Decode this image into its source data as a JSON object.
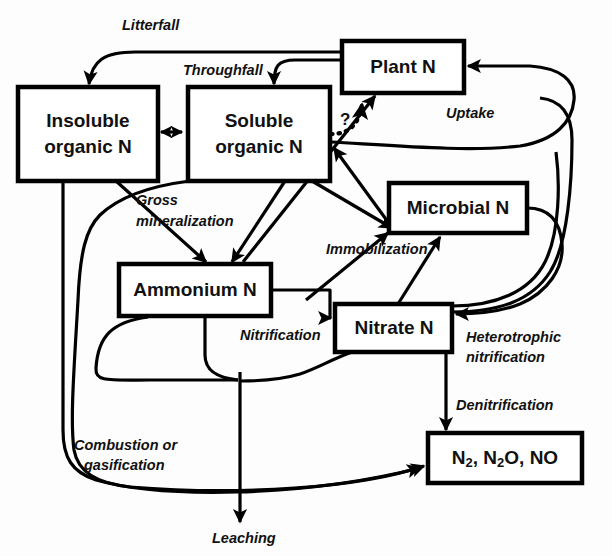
{
  "figure": {
    "background_color": "#fdfdfd",
    "line_color": "#000000",
    "box_fill": "#ffffff"
  },
  "pools": [
    {
      "id": "insoluble-organic-n",
      "line1": "Insoluble",
      "line2": "organic N"
    },
    {
      "id": "soluble-organic-n",
      "line1": "Soluble",
      "line2": "organic N"
    },
    {
      "id": "plant-n",
      "line1": "Plant N",
      "line2": ""
    },
    {
      "id": "microbial-n",
      "line1": "Microbial N",
      "line2": ""
    },
    {
      "id": "ammonium-n",
      "line1": "Ammonium N",
      "line2": ""
    },
    {
      "id": "nitrate-n",
      "line1": "Nitrate N",
      "line2": ""
    },
    {
      "id": "gases",
      "line1": "N2, N2O, NO",
      "line2": ""
    }
  ],
  "gas_box": {
    "segments": [
      "N",
      "2",
      ", N",
      "2",
      "O, NO"
    ]
  },
  "fluxes": [
    {
      "id": "litterfall",
      "line1": "Litterfall",
      "line2": ""
    },
    {
      "id": "throughfall",
      "line1": "Throughfall",
      "line2": ""
    },
    {
      "id": "gross-mineralization",
      "line1": "Gross",
      "line2": "mineralization"
    },
    {
      "id": "uptake",
      "line1": "Uptake",
      "line2": ""
    },
    {
      "id": "unknown",
      "line1": "?",
      "line2": ""
    },
    {
      "id": "immobilization",
      "line1": "Immobilization",
      "line2": ""
    },
    {
      "id": "nitrification",
      "line1": "Nitrification",
      "line2": ""
    },
    {
      "id": "heterotrophic-nitrification",
      "line1": "Heterotrophic",
      "line2": "nitrification"
    },
    {
      "id": "denitrification",
      "line1": "Denitrification",
      "line2": ""
    },
    {
      "id": "combustion-or-gasification",
      "line1": "Combustion or",
      "line2": "gasification"
    },
    {
      "id": "leaching",
      "line1": "Leaching",
      "line2": ""
    }
  ]
}
